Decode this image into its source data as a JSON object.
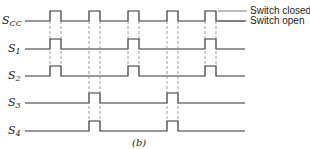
{
  "diagram": {
    "caption": "(b)",
    "legend": {
      "high_label": "Switch closed",
      "low_label": "Switch open"
    },
    "colors": {
      "line": "#333333",
      "dash": "#888888",
      "text": "#222222"
    },
    "signals": [
      {
        "name": "S",
        "sub": "CC",
        "pulses": [
          1,
          2,
          3,
          4,
          5
        ]
      },
      {
        "name": "S",
        "sub": "1",
        "pulses": [
          1,
          3,
          5
        ]
      },
      {
        "name": "S",
        "sub": "2",
        "pulses": [
          1,
          3,
          5
        ]
      },
      {
        "name": "S",
        "sub": "3",
        "pulses": [
          2,
          4
        ]
      },
      {
        "name": "S",
        "sub": "4",
        "pulses": [
          2,
          4
        ]
      }
    ]
  }
}
